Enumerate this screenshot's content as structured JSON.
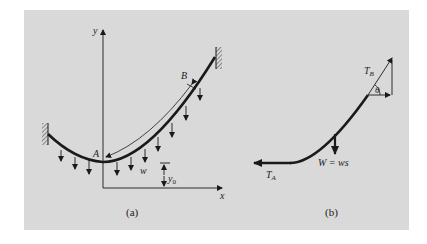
{
  "figure": {
    "panel_color": "#d9d9d9",
    "ink_color": "#1a1a1a",
    "part_a": {
      "caption": "(a)",
      "axis_x_label": "x",
      "axis_y_label": "y",
      "point_A": "A",
      "point_B": "B",
      "load_label": "w",
      "offset_label": "y",
      "offset_subscript": "0"
    },
    "part_b": {
      "caption": "(b)",
      "tension_A": "T",
      "tension_A_sub": "A",
      "tension_B": "T",
      "tension_B_sub": "B",
      "angle_label": "θ",
      "weight_label": "W = ws"
    }
  }
}
